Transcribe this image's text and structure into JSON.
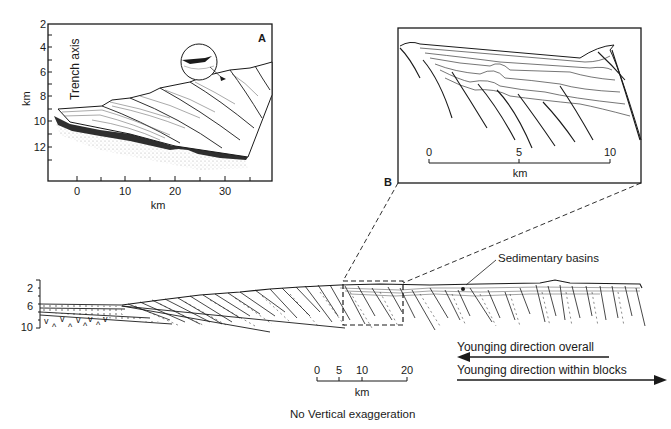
{
  "figure": {
    "panel_a": {
      "label": "A",
      "side_label": "Trench axis",
      "y_axis": {
        "label": "km",
        "ticks": [
          "2",
          "4",
          "6",
          "8",
          "10",
          "12"
        ]
      },
      "x_axis": {
        "label": "km",
        "ticks": [
          "0",
          "10",
          "20",
          "30"
        ]
      }
    },
    "panel_b": {
      "label": "B",
      "scale": {
        "ticks": [
          "0",
          "5",
          "10"
        ],
        "unit": "km"
      }
    },
    "main_section": {
      "y_ticks": [
        "2",
        "6",
        "10"
      ],
      "annotation": "Sedimentary basins",
      "scale": {
        "ticks": [
          "0",
          "5",
          "10",
          "20"
        ],
        "unit": "km"
      },
      "arrows": {
        "overall": "Younging direction overall",
        "within_blocks": "Younging direction within blocks"
      },
      "note": "No Vertical exaggeration"
    }
  },
  "colors": {
    "ink": "#1a1a1a",
    "dark_fill": "#2e2e2e",
    "stipple": "#bdbdbd"
  }
}
